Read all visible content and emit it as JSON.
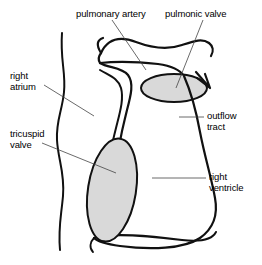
{
  "figure": {
    "background_color": "#ffffff",
    "line_color": "#111111",
    "valve_fill_color": "#d9d9d9",
    "leader_color": "#444444"
  },
  "labels": {
    "pulmonary_artery": "pulmonary artery",
    "pulmonic_valve": "pulmonic valve",
    "right_atrium_line1": "right",
    "right_atrium_line2": "atrium",
    "tricuspid_valve_line1": "tricuspid",
    "tricuspid_valve_line2": "valve",
    "outflow_tract_line1": "outflow",
    "outflow_tract_line2": "tract",
    "right_ventricle_line1": "right",
    "right_ventricle_line2": "ventricle"
  },
  "structures": {
    "pulmonary_artery": "pulmonary-artery",
    "pulmonic_valve": "pulmonic-valve",
    "right_atrium": "right-atrium",
    "tricuspid_valve": "tricuspid-valve",
    "outflow_tract": "outflow-tract",
    "right_ventricle": "right-ventricle"
  }
}
